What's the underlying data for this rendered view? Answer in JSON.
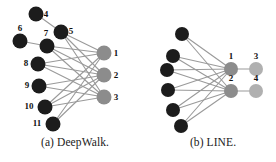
{
  "figure": {
    "background": "#ffffff",
    "edge_color": "#9a9a9a",
    "dark_node_color": "#1c1c1c",
    "gray_node_color": "#8c8c8c",
    "light_gray_node_color": "#b0b0b0",
    "label_color": "#111111"
  },
  "panel_a": {
    "caption": "(a) DeepWalk.",
    "nodes": [
      {
        "id": "a4",
        "label": "4",
        "x": 36,
        "y": 14,
        "r": 7.5,
        "type": "dark",
        "label_dx": 10,
        "label_dy": 3
      },
      {
        "id": "a5",
        "label": "5",
        "x": 61,
        "y": 32,
        "r": 7.5,
        "type": "dark",
        "label_dx": 10,
        "label_dy": 2
      },
      {
        "id": "a6",
        "label": "6",
        "x": 20,
        "y": 41,
        "r": 7.5,
        "type": "dark",
        "label_dx": 0,
        "label_dy": -10
      },
      {
        "id": "a7",
        "label": "7",
        "x": 47,
        "y": 46,
        "r": 7.5,
        "type": "dark",
        "label_dx": -1,
        "label_dy": -10
      },
      {
        "id": "a8",
        "label": "8",
        "x": 38,
        "y": 64,
        "r": 7.5,
        "type": "dark",
        "label_dx": -12,
        "label_dy": 2
      },
      {
        "id": "a9",
        "label": "9",
        "x": 39,
        "y": 86,
        "r": 7.5,
        "type": "dark",
        "label_dx": -12,
        "label_dy": 2
      },
      {
        "id": "a10",
        "label": "10",
        "x": 45,
        "y": 107,
        "r": 7.5,
        "type": "dark",
        "label_dx": -16,
        "label_dy": 2
      },
      {
        "id": "a11",
        "label": "11",
        "x": 53,
        "y": 124,
        "r": 7.5,
        "type": "dark",
        "label_dx": -16,
        "label_dy": 2
      },
      {
        "id": "a1",
        "label": "1",
        "x": 104,
        "y": 53,
        "r": 7.5,
        "type": "gray",
        "label_dx": 12,
        "label_dy": 3
      },
      {
        "id": "a2",
        "label": "2",
        "x": 104,
        "y": 75,
        "r": 7.5,
        "type": "gray",
        "label_dx": 12,
        "label_dy": 3
      },
      {
        "id": "a3",
        "label": "3",
        "x": 104,
        "y": 97,
        "r": 7.5,
        "type": "gray",
        "label_dx": 12,
        "label_dy": 3
      }
    ],
    "edges": [
      {
        "from": "a4",
        "to": "a5"
      },
      {
        "from": "a6",
        "to": "a7"
      },
      {
        "from": "a5",
        "to": "a1"
      },
      {
        "from": "a5",
        "to": "a2"
      },
      {
        "from": "a5",
        "to": "a3"
      },
      {
        "from": "a7",
        "to": "a1"
      },
      {
        "from": "a7",
        "to": "a2"
      },
      {
        "from": "a7",
        "to": "a3"
      },
      {
        "from": "a8",
        "to": "a1"
      },
      {
        "from": "a8",
        "to": "a2"
      },
      {
        "from": "a8",
        "to": "a3"
      },
      {
        "from": "a9",
        "to": "a2"
      },
      {
        "from": "a9",
        "to": "a3"
      },
      {
        "from": "a10",
        "to": "a1"
      },
      {
        "from": "a10",
        "to": "a2"
      },
      {
        "from": "a10",
        "to": "a3"
      },
      {
        "from": "a11",
        "to": "a1"
      },
      {
        "from": "a11",
        "to": "a2"
      }
    ]
  },
  "panel_b": {
    "caption": "(b) LINE.",
    "nodes": [
      {
        "id": "b5",
        "label": "",
        "x": 32,
        "y": 34,
        "r": 7,
        "type": "dark",
        "label_dx": 0,
        "label_dy": 0
      },
      {
        "id": "b6",
        "label": "",
        "x": 23,
        "y": 56,
        "r": 7,
        "type": "dark",
        "label_dx": 0,
        "label_dy": 0
      },
      {
        "id": "b7",
        "label": "",
        "x": 17,
        "y": 70,
        "r": 7,
        "type": "dark",
        "label_dx": 0,
        "label_dy": 0
      },
      {
        "id": "b8",
        "label": "",
        "x": 18,
        "y": 90,
        "r": 7,
        "type": "dark",
        "label_dx": 0,
        "label_dy": 0
      },
      {
        "id": "b9",
        "label": "",
        "x": 23,
        "y": 110,
        "r": 7,
        "type": "dark",
        "label_dx": 0,
        "label_dy": 0
      },
      {
        "id": "b10",
        "label": "",
        "x": 31,
        "y": 126,
        "r": 7,
        "type": "dark",
        "label_dx": 0,
        "label_dy": 0
      },
      {
        "id": "b1",
        "label": "1",
        "x": 81,
        "y": 69,
        "r": 7,
        "type": "gray",
        "label_dx": 0,
        "label_dy": -10
      },
      {
        "id": "b2",
        "label": "2",
        "x": 81,
        "y": 91,
        "r": 7,
        "type": "gray",
        "label_dx": 0,
        "label_dy": -10
      },
      {
        "id": "b3",
        "label": "3",
        "x": 106,
        "y": 69,
        "r": 7,
        "type": "light",
        "label_dx": 0,
        "label_dy": -10
      },
      {
        "id": "b4",
        "label": "4",
        "x": 106,
        "y": 91,
        "r": 7,
        "type": "light",
        "label_dx": 0,
        "label_dy": -10
      }
    ],
    "edges": [
      {
        "from": "b5",
        "to": "b1"
      },
      {
        "from": "b5",
        "to": "b2"
      },
      {
        "from": "b6",
        "to": "b1"
      },
      {
        "from": "b6",
        "to": "b2"
      },
      {
        "from": "b7",
        "to": "b1"
      },
      {
        "from": "b7",
        "to": "b2"
      },
      {
        "from": "b8",
        "to": "b1"
      },
      {
        "from": "b8",
        "to": "b2"
      },
      {
        "from": "b9",
        "to": "b1"
      },
      {
        "from": "b9",
        "to": "b2"
      },
      {
        "from": "b10",
        "to": "b1"
      },
      {
        "from": "b10",
        "to": "b2"
      },
      {
        "from": "b1",
        "to": "b3"
      },
      {
        "from": "b2",
        "to": "b4"
      }
    ]
  }
}
